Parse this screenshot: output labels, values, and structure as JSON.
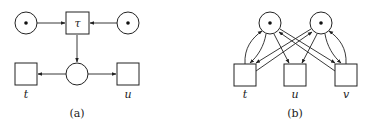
{
  "figure": {
    "subfigures": [
      {
        "caption": "(a)",
        "places": [
          {
            "id": "p_left",
            "tokens": 1
          },
          {
            "id": "p_right",
            "tokens": 1
          },
          {
            "id": "p_mid",
            "tokens": 0
          }
        ],
        "transitions": [
          {
            "id": "tau",
            "label": "τ"
          },
          {
            "id": "t",
            "label": "t"
          },
          {
            "id": "u",
            "label": "u"
          }
        ],
        "arcs": [
          [
            "p_left",
            "tau"
          ],
          [
            "p_right",
            "tau"
          ],
          [
            "tau",
            "p_mid"
          ],
          [
            "p_mid",
            "t"
          ],
          [
            "p_mid",
            "u"
          ]
        ]
      },
      {
        "caption": "(b)",
        "places": [
          {
            "id": "p1",
            "tokens": 1
          },
          {
            "id": "p2",
            "tokens": 1
          }
        ],
        "transitions": [
          {
            "id": "t",
            "label": "t"
          },
          {
            "id": "u",
            "label": "u"
          },
          {
            "id": "v",
            "label": "v"
          }
        ],
        "arcs": [
          [
            "p1",
            "t"
          ],
          [
            "t",
            "p1"
          ],
          [
            "p1",
            "u"
          ],
          [
            "p1",
            "v"
          ],
          [
            "p2",
            "v"
          ],
          [
            "v",
            "p2"
          ],
          [
            "p2",
            "u"
          ],
          [
            "p2",
            "t"
          ],
          [
            "t",
            "p2"
          ],
          [
            "v",
            "p1"
          ]
        ]
      }
    ]
  },
  "colors": {
    "stroke": "#222222",
    "background": "#ffffff"
  }
}
